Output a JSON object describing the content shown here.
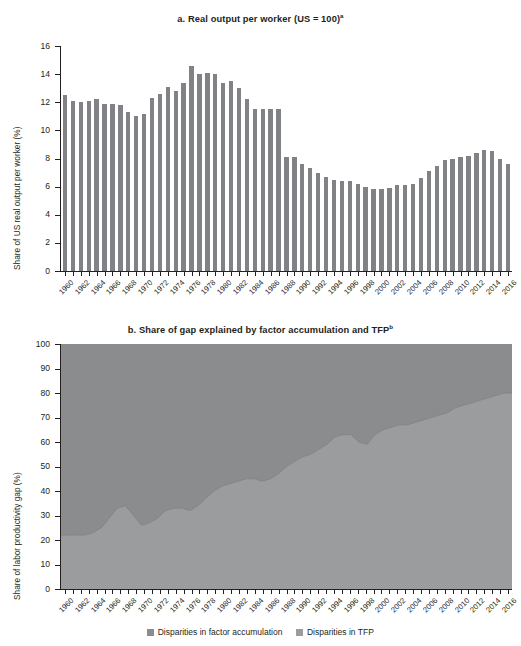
{
  "colors": {
    "factor_accumulation": "#8a8c8e",
    "tfp": "#9a9c9e",
    "bar": "#808285",
    "axis": "#231f20"
  },
  "panel_a": {
    "title": "a. Real output per worker (US = 100)",
    "title_superscript": "a",
    "ylabel": "Share of US real output per worker (%)",
    "yticks": [
      "0",
      "2",
      "4",
      "6",
      "8",
      "10",
      "12",
      "14",
      "16"
    ]
  },
  "panel_b": {
    "title": "b. Share of gap explained by factor accumulation and TFP",
    "title_superscript": "b",
    "ylabel": "Share of labor productivity gap (%)",
    "yticks": [
      "0",
      "10",
      "20",
      "30",
      "40",
      "50",
      "60",
      "70",
      "80",
      "90",
      "100"
    ]
  },
  "legend": {
    "items": [
      {
        "label": "Disparities in factor accumulation",
        "color": "#8a8c8e"
      },
      {
        "label": "Disparities in TFP",
        "color": "#9a9c9e"
      }
    ]
  },
  "chart_data": [
    {
      "type": "bar",
      "title": "a. Real output per worker (US = 100)",
      "xlabel": "",
      "ylabel": "Share of US real output per worker (%)",
      "ylim": [
        0,
        16
      ],
      "grid": false,
      "tick_label_step": 2,
      "categories": [
        "1960",
        "1961",
        "1962",
        "1963",
        "1964",
        "1965",
        "1966",
        "1967",
        "1968",
        "1969",
        "1970",
        "1971",
        "1972",
        "1973",
        "1974",
        "1975",
        "1976",
        "1977",
        "1978",
        "1979",
        "1980",
        "1981",
        "1982",
        "1983",
        "1984",
        "1985",
        "1986",
        "1987",
        "1988",
        "1989",
        "1990",
        "1991",
        "1992",
        "1993",
        "1994",
        "1995",
        "1996",
        "1997",
        "1998",
        "1999",
        "2000",
        "2001",
        "2002",
        "2003",
        "2004",
        "2005",
        "2006",
        "2007",
        "2008",
        "2009",
        "2010",
        "2011",
        "2012",
        "2013",
        "2014",
        "2015",
        "2016"
      ],
      "values": [
        12.5,
        12.1,
        12.0,
        12.1,
        12.2,
        11.9,
        11.9,
        11.8,
        11.3,
        11.0,
        11.2,
        12.3,
        12.6,
        13.1,
        12.8,
        13.4,
        14.6,
        14.0,
        14.1,
        14.0,
        13.4,
        13.5,
        13.0,
        12.2,
        11.5,
        11.5,
        11.5,
        11.5,
        8.1,
        8.1,
        7.6,
        7.3,
        7.0,
        6.7,
        6.5,
        6.4,
        6.4,
        6.2,
        6.0,
        5.8,
        5.8,
        5.9,
        6.1,
        6.1,
        6.2,
        6.6,
        7.1,
        7.5,
        7.9,
        8.0,
        8.1,
        8.2,
        8.4,
        8.6,
        8.5,
        8.0,
        7.6
      ]
    },
    {
      "type": "area",
      "stacked": true,
      "title": "b. Share of gap explained by factor accumulation and TFP",
      "xlabel": "",
      "ylabel": "Share of labor productivity gap (%)",
      "ylim": [
        0,
        100
      ],
      "grid": false,
      "legend_position": "bottom",
      "tick_label_step": 2,
      "x": [
        "1960",
        "1961",
        "1962",
        "1963",
        "1964",
        "1965",
        "1966",
        "1967",
        "1968",
        "1969",
        "1970",
        "1971",
        "1972",
        "1973",
        "1974",
        "1975",
        "1976",
        "1977",
        "1978",
        "1979",
        "1980",
        "1981",
        "1982",
        "1983",
        "1984",
        "1985",
        "1986",
        "1987",
        "1988",
        "1989",
        "1990",
        "1991",
        "1992",
        "1993",
        "1994",
        "1995",
        "1996",
        "1997",
        "1998",
        "1999",
        "2000",
        "2001",
        "2002",
        "2003",
        "2004",
        "2005",
        "2006",
        "2007",
        "2008",
        "2009",
        "2010",
        "2011",
        "2012",
        "2013",
        "2014",
        "2015",
        "2016"
      ],
      "series": [
        {
          "name": "Disparities in factor accumulation",
          "color": "#9a9c9e",
          "values": [
            22,
            22,
            22,
            22,
            23,
            25,
            29,
            33,
            34,
            30,
            26,
            27,
            29,
            32,
            33,
            33,
            32,
            34,
            37,
            40,
            42,
            43,
            44,
            45,
            45,
            44,
            45,
            47,
            50,
            52,
            54,
            55,
            57,
            59,
            62,
            63,
            63,
            60,
            59,
            63,
            65,
            66,
            67,
            67,
            68,
            69,
            70,
            71,
            72,
            74,
            75,
            76,
            77,
            78,
            79,
            80,
            80
          ]
        },
        {
          "name": "Disparities in TFP",
          "color": "#8a8c8e",
          "values": [
            78,
            78,
            78,
            78,
            77,
            75,
            71,
            67,
            66,
            70,
            74,
            73,
            71,
            68,
            67,
            67,
            68,
            66,
            63,
            60,
            58,
            57,
            56,
            55,
            55,
            56,
            55,
            53,
            50,
            48,
            46,
            45,
            43,
            41,
            38,
            37,
            37,
            40,
            41,
            37,
            35,
            34,
            33,
            33,
            32,
            31,
            30,
            29,
            28,
            26,
            25,
            24,
            23,
            22,
            21,
            20,
            20
          ]
        }
      ]
    }
  ]
}
